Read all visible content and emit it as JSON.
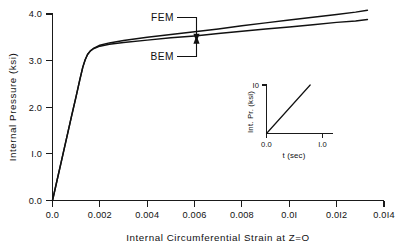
{
  "chart_data": {
    "type": "line",
    "title": "",
    "xlabel": "Internal  Circumferential  Strain  at  Z=O",
    "ylabel": "Internal  Pressure  (ksi)",
    "xlim": [
      0.0,
      0.014
    ],
    "ylim": [
      0.0,
      4.0
    ],
    "grid": false,
    "legend_position": "inline-annotation",
    "xticks": [
      "0.0",
      "0.002",
      "0.004",
      "0.006",
      "0.008",
      "0.0I",
      "0.0I2",
      "0.0I4"
    ],
    "xtick_values": [
      0.0,
      0.002,
      0.004,
      0.006,
      0.008,
      0.01,
      0.012,
      0.014
    ],
    "yticks": [
      "0.0",
      "I.0",
      "2.0",
      "3.0",
      "4.0"
    ],
    "ytick_values": [
      0.0,
      1.0,
      2.0,
      3.0,
      4.0
    ],
    "series": [
      {
        "name": "FEM",
        "label": "FEM",
        "points": [
          [
            0.0,
            0.0
          ],
          [
            0.0002,
            0.45
          ],
          [
            0.0004,
            0.9
          ],
          [
            0.0006,
            1.35
          ],
          [
            0.0008,
            1.8
          ],
          [
            0.001,
            2.24
          ],
          [
            0.00115,
            2.58
          ],
          [
            0.00128,
            2.86
          ],
          [
            0.00138,
            3.02
          ],
          [
            0.00148,
            3.13
          ],
          [
            0.0016,
            3.21
          ],
          [
            0.00175,
            3.27
          ],
          [
            0.002,
            3.33
          ],
          [
            0.0024,
            3.38
          ],
          [
            0.003,
            3.43
          ],
          [
            0.004,
            3.5
          ],
          [
            0.005,
            3.56
          ],
          [
            0.006,
            3.62
          ],
          [
            0.007,
            3.68
          ],
          [
            0.008,
            3.75
          ],
          [
            0.009,
            3.81
          ],
          [
            0.01,
            3.87
          ],
          [
            0.011,
            3.93
          ],
          [
            0.012,
            3.99
          ],
          [
            0.0128,
            4.04
          ],
          [
            0.0133,
            4.08
          ]
        ]
      },
      {
        "name": "BEM",
        "label": "BEM",
        "points": [
          [
            0.0,
            0.0
          ],
          [
            0.0002,
            0.45
          ],
          [
            0.0004,
            0.9
          ],
          [
            0.0006,
            1.35
          ],
          [
            0.0008,
            1.8
          ],
          [
            0.001,
            2.24
          ],
          [
            0.00115,
            2.58
          ],
          [
            0.00128,
            2.86
          ],
          [
            0.00138,
            3.02
          ],
          [
            0.00148,
            3.13
          ],
          [
            0.0016,
            3.21
          ],
          [
            0.00175,
            3.26
          ],
          [
            0.002,
            3.31
          ],
          [
            0.0024,
            3.35
          ],
          [
            0.003,
            3.39
          ],
          [
            0.004,
            3.44
          ],
          [
            0.005,
            3.49
          ],
          [
            0.006,
            3.53
          ],
          [
            0.007,
            3.58
          ],
          [
            0.008,
            3.63
          ],
          [
            0.009,
            3.68
          ],
          [
            0.01,
            3.72
          ],
          [
            0.011,
            3.77
          ],
          [
            0.012,
            3.82
          ],
          [
            0.0128,
            3.85
          ],
          [
            0.0133,
            3.88
          ]
        ]
      }
    ],
    "annotations": [
      {
        "text": "FEM",
        "target_x": 0.006,
        "target_y": 3.62,
        "series": "FEM"
      },
      {
        "text": "BEM",
        "target_x": 0.006,
        "target_y": 3.53,
        "series": "BEM"
      }
    ],
    "inset": {
      "type": "line",
      "xlabel": "t (sec)",
      "ylabel": "Int. Pr. (ksi)",
      "xlim": [
        0.0,
        1.0
      ],
      "ylim": [
        0.0,
        10.0
      ],
      "xticks": [
        "0.0",
        "I.0"
      ],
      "xtick_values": [
        0.0,
        1.0
      ],
      "yticks": [
        "I0"
      ],
      "ytick_values": [
        10
      ],
      "series": [
        {
          "name": "pressure-ramp",
          "points": [
            [
              0.0,
              0.0
            ],
            [
              0.78,
              10.0
            ]
          ]
        }
      ]
    }
  }
}
